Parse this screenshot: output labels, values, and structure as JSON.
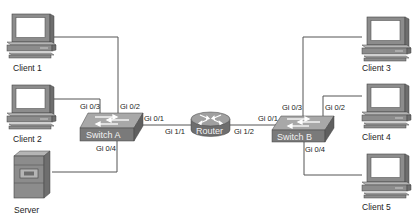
{
  "diagram": {
    "type": "network-topology",
    "colors": {
      "line": "#555555",
      "device_dark": "#6e6e6e",
      "device_mid": "#8c8c8c",
      "device_light": "#b5b5b5",
      "screen": "#ffffff",
      "label_text": "#222222",
      "device_text": "#f2f2f2"
    },
    "nodes": {
      "client1": {
        "label": "Client 1",
        "icon": "desktop-computer-icon"
      },
      "client2": {
        "label": "Client 2",
        "icon": "desktop-computer-icon"
      },
      "server": {
        "label": "Server",
        "icon": "server-tower-icon"
      },
      "switchA": {
        "label": "Switch A",
        "icon": "switch-icon"
      },
      "router": {
        "label": "Router",
        "icon": "router-icon"
      },
      "switchB": {
        "label": "Switch B",
        "icon": "switch-icon"
      },
      "client3": {
        "label": "Client 3",
        "icon": "desktop-computer-icon"
      },
      "client4": {
        "label": "Client 4",
        "icon": "desktop-computer-icon"
      },
      "client5": {
        "label": "Client 5",
        "icon": "desktop-computer-icon"
      }
    },
    "ports": {
      "switchA_gi02": "Gi 0/2",
      "switchA_gi03": "Gi 0/3",
      "switchA_gi04": "Gi 0/4",
      "switchA_gi01": "Gi 0/1",
      "router_gi11": "Gi 1/1",
      "router_gi12": "Gi 1/2",
      "switchB_gi01": "Gi 0/1",
      "switchB_gi03": "Gi 0/3",
      "switchB_gi02": "Gi 0/2",
      "switchB_gi04": "Gi 0/4"
    },
    "links": [
      {
        "from": "client1",
        "to": "switchA",
        "port": "Gi 0/2"
      },
      {
        "from": "client2",
        "to": "switchA",
        "port": "Gi 0/3"
      },
      {
        "from": "server",
        "to": "switchA",
        "port": "Gi 0/4"
      },
      {
        "from": "switchA",
        "from_port": "Gi 0/1",
        "to": "router",
        "to_port": "Gi 1/1"
      },
      {
        "from": "router",
        "from_port": "Gi 1/2",
        "to": "switchB",
        "to_port": "Gi 0/1"
      },
      {
        "from": "switchB",
        "to": "client3",
        "port": "Gi 0/3"
      },
      {
        "from": "switchB",
        "to": "client4",
        "port": "Gi 0/2"
      },
      {
        "from": "switchB",
        "to": "client5",
        "port": "Gi 0/4"
      }
    ]
  }
}
